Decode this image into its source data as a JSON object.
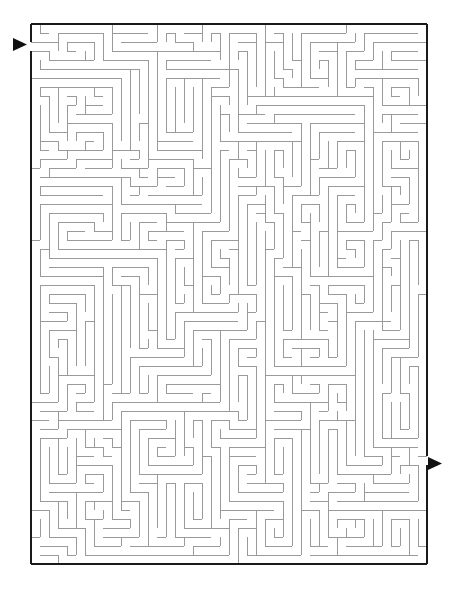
{
  "page": {
    "background_color": "#ffffff",
    "width": 460,
    "height": 589
  },
  "maze": {
    "type": "perfect-maze",
    "columns": 44,
    "rows": 60,
    "cell_size": 9,
    "origin_x": 31,
    "origin_y": 24,
    "border_color": "#1a1a1a",
    "border_width": 2,
    "wall_color": "#9a9a9a",
    "wall_width": 1,
    "seed": 20240917,
    "entrance": {
      "label": "entrance",
      "side": "left",
      "row": 2,
      "arrow_color": "#111111",
      "arrow_x": 13,
      "arrow_y": 38,
      "arrow_width": 14,
      "arrow_height": 13
    },
    "exit": {
      "label": "exit",
      "side": "right",
      "row": 48,
      "arrow_color": "#111111",
      "arrow_x": 428,
      "arrow_y": 457,
      "arrow_width": 14,
      "arrow_height": 13
    }
  }
}
